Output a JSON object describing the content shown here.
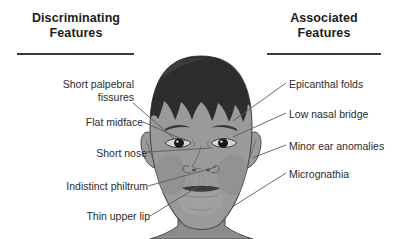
{
  "figure": {
    "background_color": "#ffffff",
    "width": 402,
    "height": 239
  },
  "columns": {
    "left": {
      "heading": "Discriminating\nFeatures",
      "rule_color": "#3a3a3a",
      "items": [
        {
          "label": "Short palpebral\nfissures",
          "points_to": "left-eye"
        },
        {
          "label": "Flat midface",
          "points_to": "midface"
        },
        {
          "label": "Short nose",
          "points_to": "nose"
        },
        {
          "label": "Indistinct philtrum",
          "points_to": "philtrum"
        },
        {
          "label": "Thin upper lip",
          "points_to": "upper-lip"
        }
      ]
    },
    "right": {
      "heading": "Associated\nFeatures",
      "rule_color": "#3a3a3a",
      "items": [
        {
          "label": "Epicanthal folds",
          "points_to": "epicanthus"
        },
        {
          "label": "Low nasal bridge",
          "points_to": "nasal-bridge"
        },
        {
          "label": "Minor ear anomalies",
          "points_to": "ear"
        },
        {
          "label": "Micrognathia",
          "points_to": "chin"
        }
      ]
    }
  },
  "illustration": {
    "name": "child-face-front-view",
    "colors": {
      "hair": "#2f2d2c",
      "skin": "#9b9a99",
      "skin_shadow": "#868584",
      "skin_highlight": "#b2b1b0",
      "outline": "#4a4949",
      "eye_white": "#d8d7d6",
      "iris": "#1a1919",
      "leader_line": "#5a5959"
    }
  }
}
